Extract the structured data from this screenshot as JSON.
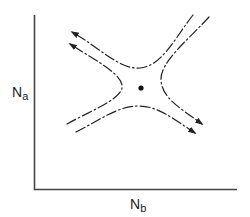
{
  "figure": {
    "type": "phase-plane diagram (saddle point)",
    "axes": {
      "y_label": {
        "main": "N",
        "sub": "a"
      },
      "x_label": {
        "main": "N",
        "sub": "b"
      }
    },
    "elements": {
      "equilibrium_point": "saddle point (filled dot)",
      "trajectories": [
        {
          "id": "upper-left",
          "description": "hyperbolic trajectory from upper right, curving above the saddle, exiting toward upper left",
          "arrow": "upper-left"
        },
        {
          "id": "left",
          "description": "hyperbolic trajectory from lower left, curving left of the saddle, exiting toward upper left",
          "arrow": "upper-left"
        },
        {
          "id": "right",
          "description": "hyperbolic trajectory from upper right, curving right of the saddle, exiting toward lower right",
          "arrow": "lower-right"
        },
        {
          "id": "bottom",
          "description": "hyperbolic trajectory from lower left, curving below the saddle, exiting toward lower right",
          "arrow": "lower-right"
        }
      ],
      "line_style": "dash-dot"
    },
    "colors": {
      "ink": "#222222",
      "axis": "#444444",
      "background": "#ffffff"
    }
  }
}
